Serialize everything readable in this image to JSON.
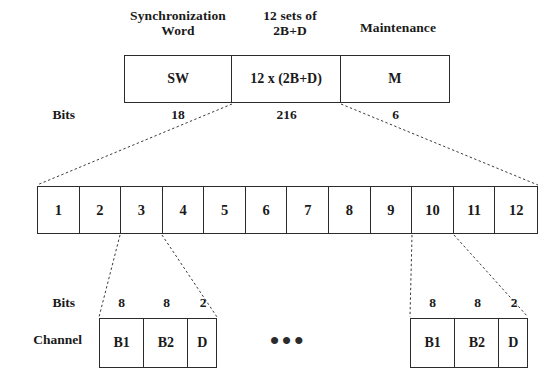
{
  "diagram": {
    "title_labels": {
      "sync": "Synchronization\nWord",
      "sets": "12 sets of\n2B+D",
      "maintenance": "Maintenance"
    },
    "top_frame": {
      "cells": [
        {
          "label": "SW",
          "bits": "18"
        },
        {
          "label": "12 x (2B+D)",
          "bits": "216"
        },
        {
          "label": "M",
          "bits": "6"
        }
      ]
    },
    "side_labels": {
      "bits_top": "Bits",
      "bits_bottom": "Bits",
      "channel": "Channel"
    },
    "channel_row": {
      "cells": [
        "1",
        "2",
        "3",
        "4",
        "5",
        "6",
        "7",
        "8",
        "9",
        "10",
        "11",
        "12"
      ]
    },
    "subframe_left": {
      "bits": [
        "8",
        "8",
        "2"
      ],
      "cells": [
        "B1",
        "B2",
        "D"
      ]
    },
    "subframe_right": {
      "bits": [
        "8",
        "8",
        "2"
      ],
      "cells": [
        "B1",
        "B2",
        "D"
      ]
    },
    "ellipsis": "•••",
    "colors": {
      "stroke": "#2b2b2b",
      "text": "#1a1a1a",
      "background": "#ffffff"
    }
  }
}
